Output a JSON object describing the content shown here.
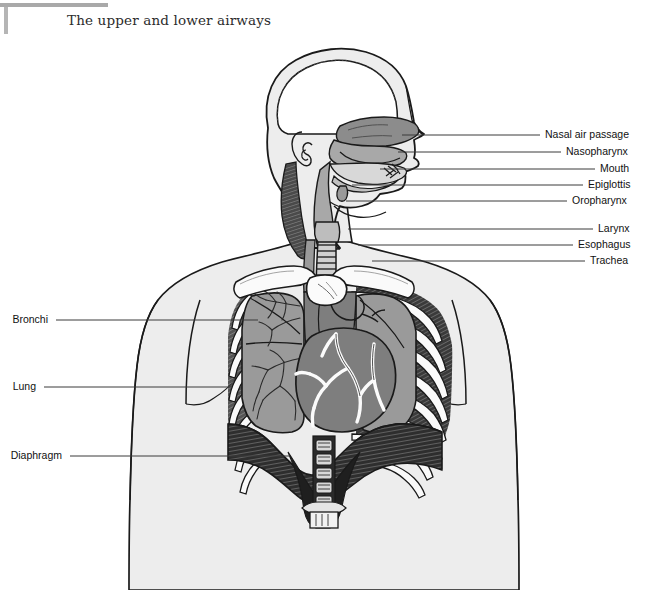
{
  "figure": {
    "title": "The upper and lower airways",
    "background_color": "#ffffff",
    "corner_rule_color": "#a9a9a9",
    "body_fill": "#ededed",
    "outline_color": "#1a1a1a",
    "leader_color": "#3a3a3a"
  },
  "labels": {
    "right": [
      {
        "text": "Nasal air passage",
        "label_x": 545,
        "label_y": 135,
        "line_x1": 402,
        "line_x2": 540,
        "line_y": 135
      },
      {
        "text": "Nasopharynx",
        "label_x": 566,
        "label_y": 152,
        "line_x1": 398,
        "line_x2": 561,
        "line_y": 152
      },
      {
        "text": "Mouth",
        "label_x": 600,
        "label_y": 169,
        "line_x1": 380,
        "line_x2": 595,
        "line_y": 169
      },
      {
        "text": "Epiglottis",
        "label_x": 588,
        "label_y": 185,
        "line_x1": 352,
        "line_x2": 583,
        "line_y": 185
      },
      {
        "text": "Oropharynx",
        "label_x": 572,
        "label_y": 201,
        "line_x1": 346,
        "line_x2": 567,
        "line_y": 201
      },
      {
        "text": "Larynx",
        "label_x": 598,
        "label_y": 229,
        "line_x1": 348,
        "line_x2": 593,
        "line_y": 229
      },
      {
        "text": "Esophagus",
        "label_x": 578,
        "label_y": 245,
        "line_x1": 358,
        "line_x2": 573,
        "line_y": 245
      },
      {
        "text": "Trachea",
        "label_x": 590,
        "label_y": 261,
        "line_x1": 372,
        "line_x2": 585,
        "line_y": 261
      }
    ],
    "left": [
      {
        "text": "Bronchi",
        "label_x": 48,
        "label_y": 320,
        "line_x1": 56,
        "line_x2": 258,
        "line_y": 320
      },
      {
        "text": "Lung",
        "label_x": 36,
        "label_y": 387,
        "line_x1": 44,
        "line_x2": 232,
        "line_y": 387
      },
      {
        "text": "Diaphragm",
        "label_x": 62,
        "label_y": 456,
        "line_x1": 70,
        "line_x2": 290,
        "line_y": 456
      }
    ]
  },
  "anatomy": {
    "structures": [
      "head-sagittal-section",
      "brain-cavity",
      "nasal-air-passage",
      "nasopharynx",
      "oral-cavity",
      "tongue",
      "soft-palate",
      "epiglottis",
      "oropharynx",
      "larynx",
      "esophagus",
      "trachea",
      "neck-muscle",
      "clavicle-left",
      "clavicle-right",
      "sternum",
      "rib-cage",
      "lung-left",
      "lung-right",
      "bronchial-tree",
      "heart",
      "coronary-vessels",
      "diaphragm",
      "vertebral-column",
      "torso-silhouette",
      "shoulder-left",
      "shoulder-right"
    ],
    "tones": {
      "skin": "#ededed",
      "airway_dark": "#8c8c8c",
      "airway_mid": "#a8a8a8",
      "airway_light": "#c9c9c9",
      "lung": "#9a9a9a",
      "heart": "#7e7e7e",
      "diaphragm": "#3c3c3c",
      "muscle": "#555555",
      "bone": "#fafafa",
      "spine": "#1f1f1f"
    }
  }
}
